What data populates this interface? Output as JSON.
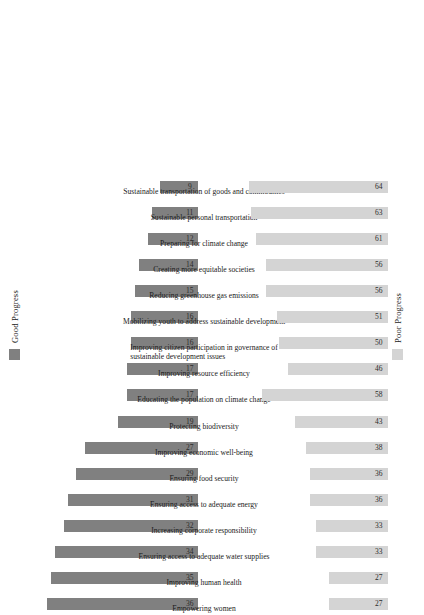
{
  "legend": {
    "good": {
      "label": "Good Progress",
      "color": "#808080",
      "swatch_name": "good-progress-swatch"
    },
    "poor": {
      "label": "Poor Progress",
      "color": "#d4d4d4",
      "swatch_name": "poor-progress-swatch"
    }
  },
  "chart_data": {
    "type": "bar",
    "title": "",
    "subtitle": "",
    "xlabel": "",
    "ylabel": "",
    "grid": false,
    "legend_position": "top-left of each panel",
    "orientation": "vertical bars, figure rotated 90 degrees counter-clockwise",
    "categories": [
      "Empowering women",
      "Improving human health",
      "Ensuring access to adequate water supplies",
      "Increasing corporate responsibility",
      "Ensuring access to adequate energy",
      "Ensuring food security",
      "Improving economic well-being",
      "Protecting biodiversity",
      "Educating the population on climate change",
      "Improving resource efficiency",
      "Improving citizen participation in governance of sustainable development issues",
      "Mobilizing youth to address sustainable development",
      "Reducing greenhouse gas emissions",
      "Creating more equitable societies",
      "Preparing for climate change",
      "Sustainable personal transportation",
      "Sustainable transportation of goods and commodities"
    ],
    "categories_lines": [
      [
        "Empowering women",
        ""
      ],
      [
        "Improving human health",
        ""
      ],
      [
        "Ensuring access to adequate water supplies",
        ""
      ],
      [
        "Increasing corporate responsibility",
        ""
      ],
      [
        "Ensuring access to adequate energy",
        ""
      ],
      [
        "Ensuring food security",
        ""
      ],
      [
        "Improving economic well-being",
        ""
      ],
      [
        "Protecting biodiversity",
        ""
      ],
      [
        "Educating the population on climate change",
        ""
      ],
      [
        "Improving resource efficiency",
        ""
      ],
      [
        "Improving citizen participation in governance of",
        "sustainable development issues"
      ],
      [
        "Mobilizing youth to address sustainable development",
        ""
      ],
      [
        "Reducing greenhouse gas emissions",
        ""
      ],
      [
        "Creating more equitable societies",
        ""
      ],
      [
        "Preparing for climate change",
        ""
      ],
      [
        "Sustainable personal transportation",
        ""
      ],
      [
        "Sustainable transportation of goods and commodities",
        ""
      ]
    ],
    "series": [
      {
        "name": "Good Progress",
        "color": "#808080",
        "values": [
          36,
          35,
          34,
          32,
          31,
          29,
          27,
          19,
          17,
          17,
          16,
          16,
          15,
          14,
          12,
          11,
          9
        ]
      },
      {
        "name": "Poor Progress",
        "color": "#d4d4d4",
        "values": [
          27,
          27,
          33,
          33,
          36,
          36,
          38,
          43,
          58,
          46,
          50,
          51,
          56,
          56,
          61,
          63,
          64
        ]
      }
    ],
    "ylim_good": [
      0,
      40
    ],
    "ylim_poor": [
      0,
      70
    ]
  }
}
